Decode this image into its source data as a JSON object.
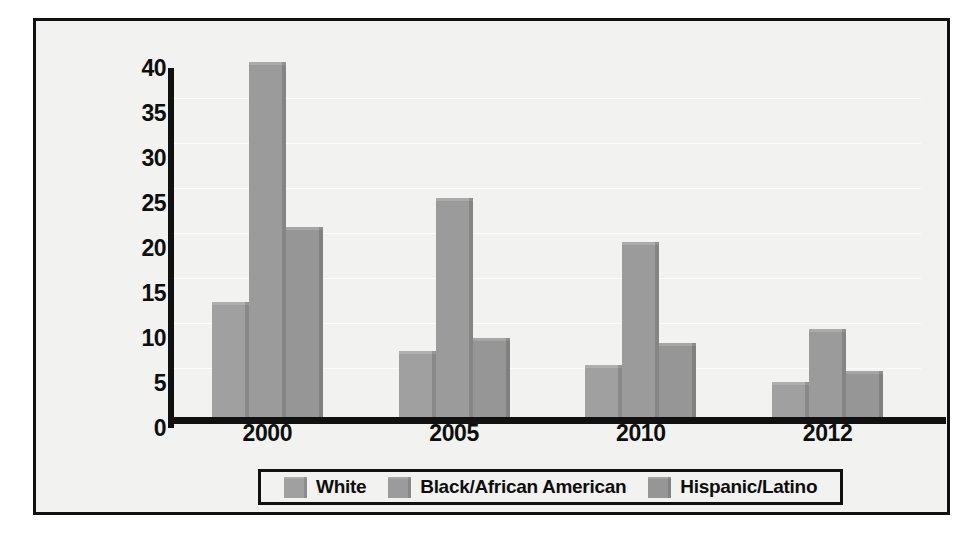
{
  "chart_data": {
    "type": "bar",
    "title": "",
    "subtitle": "",
    "xlabel": "",
    "ylabel": "",
    "categories": [
      "2000",
      "2005",
      "2010",
      "2012"
    ],
    "series": [
      {
        "name": "White",
        "values": [
          12.8,
          7.3,
          5.8,
          3.9
        ],
        "color": "#a0a0a0"
      },
      {
        "name": "Black/African American",
        "values": [
          39.5,
          24.3,
          19.4,
          9.8
        ],
        "color": "#9b9b9b"
      },
      {
        "name": "Hispanic/Latino",
        "values": [
          21.1,
          8.8,
          8.2,
          5.1
        ],
        "color": "#969696"
      }
    ],
    "ylim": [
      0,
      40
    ],
    "yticks": [
      0,
      5,
      10,
      15,
      20,
      25,
      30,
      35,
      40
    ],
    "ytick_labels": [
      "0",
      "5",
      "10",
      "15",
      "20",
      "25",
      "30",
      "35",
      "40"
    ],
    "grid": false,
    "legend_position": "bottom"
  },
  "legend": {
    "items": [
      {
        "label": "White"
      },
      {
        "label": "Black/African American"
      },
      {
        "label": "Hispanic/Latino"
      }
    ]
  },
  "colors": {
    "frame_border": "#111111",
    "plot_background": "#f2f2f0",
    "axis": "#111111",
    "text": "#0e0e0e"
  }
}
